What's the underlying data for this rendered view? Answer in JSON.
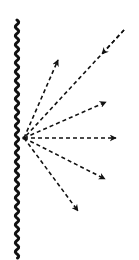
{
  "diagram": {
    "colors": {
      "background": "#ffffff",
      "stroke": "#111111"
    },
    "surface": {
      "type": "wavy-vertical-line",
      "x": 17,
      "y_start": 20,
      "y_end": 258,
      "amplitude": 1.6,
      "wavelength": 9,
      "stroke_width": 3
    },
    "source_point": {
      "x": 24,
      "y": 138
    },
    "incoming_ray": {
      "from": {
        "x": 124,
        "y": 30
      },
      "to": {
        "x": 24,
        "y": 138
      },
      "arrow_tip": {
        "x": 102,
        "y": 54
      },
      "direction": "toward-source"
    },
    "outgoing_rays": [
      {
        "label": "ray-up",
        "tip": {
          "x": 58,
          "y": 60
        }
      },
      {
        "label": "ray-upper-right",
        "tip": {
          "x": 106,
          "y": 102
        }
      },
      {
        "label": "ray-horizontal",
        "tip": {
          "x": 116,
          "y": 138
        }
      },
      {
        "label": "ray-lower-right",
        "tip": {
          "x": 105,
          "y": 179
        }
      },
      {
        "label": "ray-down",
        "tip": {
          "x": 78,
          "y": 211
        }
      }
    ],
    "dash_pattern": "4 3",
    "ray_stroke_width": 1.6
  }
}
